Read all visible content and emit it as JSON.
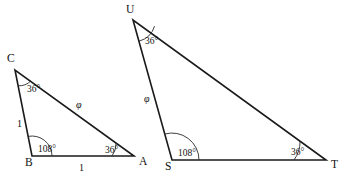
{
  "figure": {
    "background_color": "#ffffff",
    "line_color": "#1a1a1a",
    "text_color": "#111111",
    "phi_symbol": "φ",
    "degree_symbol": "°"
  },
  "triangles": [
    {
      "name": "small-triangle",
      "vertices": [
        {
          "id": "C",
          "label": "C",
          "x": 15,
          "y": 70,
          "label_x": 7,
          "label_y": 62
        },
        {
          "id": "B",
          "label": "B",
          "x": 32,
          "y": 156,
          "label_x": 25,
          "label_y": 166
        },
        {
          "id": "A",
          "label": "A",
          "x": 134,
          "y": 156,
          "label_x": 139,
          "label_y": 165
        }
      ],
      "angles": [
        {
          "at": "C",
          "value": "36°",
          "label_x": 27,
          "label_y": 92,
          "arc_radius": 16
        },
        {
          "at": "B",
          "value": "108°",
          "label_x": 38,
          "label_y": 152,
          "arc_radius": 20
        },
        {
          "at": "A",
          "value": "36°",
          "label_x": 105,
          "label_y": 153,
          "arc_radius": 22
        }
      ],
      "sides": [
        {
          "from": "C",
          "to": "B",
          "label": "1",
          "label_x": 17,
          "label_y": 127,
          "kind": "unit"
        },
        {
          "from": "B",
          "to": "A",
          "label": "1",
          "label_x": 79,
          "label_y": 171,
          "kind": "unit"
        },
        {
          "from": "C",
          "to": "A",
          "label": "φ",
          "label_x": 76,
          "label_y": 108,
          "kind": "phi"
        }
      ]
    },
    {
      "name": "large-triangle",
      "vertices": [
        {
          "id": "U",
          "label": "U",
          "x": 133,
          "y": 20,
          "label_x": 126,
          "label_y": 13
        },
        {
          "id": "S",
          "label": "S",
          "x": 172,
          "y": 160,
          "label_x": 165,
          "label_y": 170
        },
        {
          "id": "T",
          "label": "T",
          "x": 326,
          "y": 160,
          "label_x": 331,
          "label_y": 168
        }
      ],
      "angles": [
        {
          "at": "U",
          "value": "36°",
          "label_x": 145,
          "label_y": 44,
          "arc_radius": 22
        },
        {
          "at": "S",
          "value": "108°",
          "label_x": 178,
          "label_y": 156,
          "arc_radius": 27
        },
        {
          "at": "T",
          "value": "36°",
          "label_x": 291,
          "label_y": 155,
          "arc_radius": 32
        }
      ],
      "sides": [
        {
          "from": "U",
          "to": "S",
          "label": "φ",
          "label_x": 144,
          "label_y": 102,
          "kind": "phi"
        }
      ]
    }
  ]
}
